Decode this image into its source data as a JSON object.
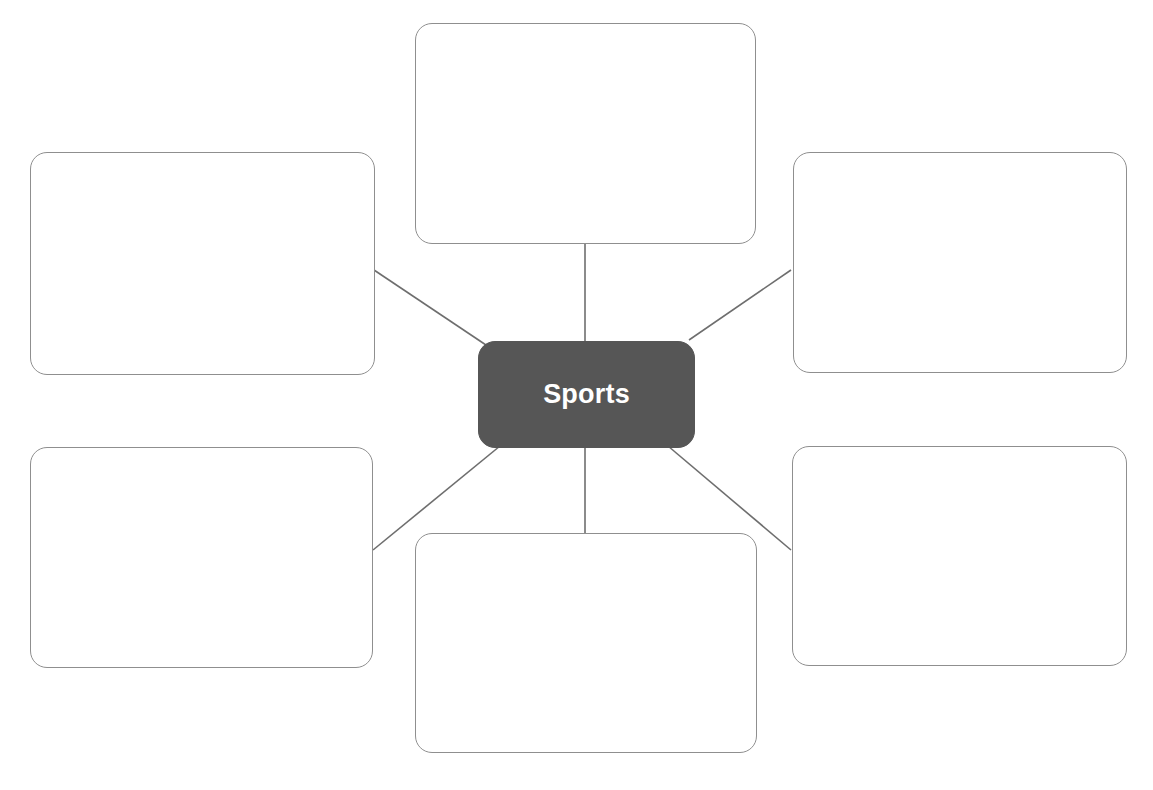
{
  "diagram": {
    "type": "concept-web",
    "title": "Sports",
    "center": {
      "label": "Sports",
      "fill_color": "#565656",
      "text_color": "#ffffff",
      "x": 478,
      "y": 341,
      "width": 217,
      "height": 107
    },
    "style": {
      "background_color": "#ffffff",
      "box_border_color": "#8f8f8f",
      "box_fill_color": "#ffffff",
      "connector_color": "#6e6e6e",
      "corner_radius_px": 17
    },
    "boxes": [
      {
        "id": "box-top",
        "label": "",
        "position": "top",
        "x": 415,
        "y": 23,
        "width": 341,
        "height": 221
      },
      {
        "id": "box-top-left",
        "label": "",
        "position": "top-left",
        "x": 30,
        "y": 152,
        "width": 345,
        "height": 223
      },
      {
        "id": "box-top-right",
        "label": "",
        "position": "top-right",
        "x": 793,
        "y": 152,
        "width": 334,
        "height": 221
      },
      {
        "id": "box-bottom-left",
        "label": "",
        "position": "bottom-left",
        "x": 30,
        "y": 447,
        "width": 343,
        "height": 221
      },
      {
        "id": "box-bottom-right",
        "label": "",
        "position": "bottom-right",
        "x": 792,
        "y": 446,
        "width": 335,
        "height": 220
      },
      {
        "id": "box-bottom",
        "label": "",
        "position": "bottom",
        "x": 415,
        "y": 533,
        "width": 342,
        "height": 220
      }
    ],
    "connectors": [
      {
        "id": "connector-top",
        "from": "center",
        "to": "box-top",
        "x1": 585,
        "y1": 341,
        "x2": 585,
        "y2": 244
      },
      {
        "id": "connector-top-left",
        "from": "center",
        "to": "box-top-left",
        "x1": 486,
        "y1": 345,
        "x2": 374,
        "y2": 270
      },
      {
        "id": "connector-top-right",
        "from": "center",
        "to": "box-top-right",
        "x1": 689,
        "y1": 340,
        "x2": 791,
        "y2": 270
      },
      {
        "id": "connector-bottom-left",
        "from": "center",
        "to": "box-bottom-left",
        "x1": 500,
        "y1": 446,
        "x2": 373,
        "y2": 550
      },
      {
        "id": "connector-bottom-right",
        "from": "center",
        "to": "box-bottom-right",
        "x1": 668,
        "y1": 446,
        "x2": 791,
        "y2": 550
      },
      {
        "id": "connector-bottom",
        "from": "center",
        "to": "box-bottom",
        "x1": 585,
        "y1": 448,
        "x2": 585,
        "y2": 533
      }
    ]
  }
}
